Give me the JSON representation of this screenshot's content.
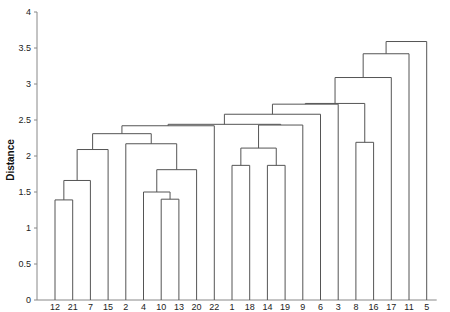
{
  "chart_data": {
    "type": "dendrogram",
    "title": "",
    "xlabel": "",
    "ylabel": "Distance",
    "ylim": [
      0,
      4
    ],
    "yticks": [
      0,
      0.5,
      1,
      1.5,
      2,
      2.5,
      3,
      3.5,
      4
    ],
    "ytick_labels": [
      "0",
      "0.5",
      "1",
      "1.5",
      "2",
      "2.5",
      "3",
      "3.5",
      "4"
    ],
    "grid": false,
    "leaves": [
      "12",
      "21",
      "7",
      "15",
      "2",
      "4",
      "10",
      "13",
      "20",
      "22",
      "1",
      "18",
      "14",
      "19",
      "9",
      "6",
      "3",
      "8",
      "16",
      "17",
      "11",
      "5"
    ],
    "merges": [
      {
        "id": "m1",
        "left": "12",
        "right": "21",
        "height": 1.39
      },
      {
        "id": "m2",
        "left": "m1",
        "right": "7",
        "height": 1.66
      },
      {
        "id": "m3",
        "left": "m2",
        "right": "15",
        "height": 2.09
      },
      {
        "id": "m4",
        "left": "10",
        "right": "13",
        "height": 1.4
      },
      {
        "id": "m5",
        "left": "4",
        "right": "m4",
        "height": 1.5
      },
      {
        "id": "m6",
        "left": "m5",
        "right": "20",
        "height": 1.81
      },
      {
        "id": "m7",
        "left": "2",
        "right": "m6",
        "height": 2.17
      },
      {
        "id": "m8",
        "left": "m3",
        "right": "m7",
        "height": 2.31
      },
      {
        "id": "m9",
        "left": "m8",
        "right": "22",
        "height": 2.42
      },
      {
        "id": "m10",
        "left": "1",
        "right": "18",
        "height": 1.87
      },
      {
        "id": "m11",
        "left": "14",
        "right": "19",
        "height": 1.87
      },
      {
        "id": "m12",
        "left": "m10",
        "right": "m11",
        "height": 2.11
      },
      {
        "id": "m13",
        "left": "m12",
        "right": "9",
        "height": 2.43
      },
      {
        "id": "m14",
        "left": "m9",
        "right": "m13",
        "height": 2.44
      },
      {
        "id": "m15",
        "left": "m14",
        "right": "6",
        "height": 2.58
      },
      {
        "id": "m16",
        "left": "m15",
        "right": "3",
        "height": 2.72
      },
      {
        "id": "m17",
        "left": "8",
        "right": "16",
        "height": 2.19
      },
      {
        "id": "m18",
        "left": "m16",
        "right": "m17",
        "height": 2.73
      },
      {
        "id": "m19",
        "left": "m18",
        "right": "17",
        "height": 3.09
      },
      {
        "id": "m20",
        "left": "m19",
        "right": "11",
        "height": 3.42
      },
      {
        "id": "m21",
        "left": "m20",
        "right": "5",
        "height": 3.59
      }
    ],
    "line_color": "#555555",
    "axis_color": "#888888"
  }
}
